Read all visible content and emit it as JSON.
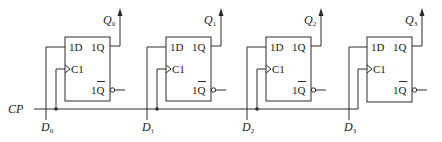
{
  "diagram": {
    "type": "4-bit parallel register (D flip-flops)",
    "clock_label": "CP",
    "flip_flops": [
      {
        "index": 0,
        "d_pin": "1D",
        "clk_pin": "C1",
        "q_pin": "1Q",
        "qbar_pin": "1Q",
        "output_label": "Q",
        "output_sub": "0",
        "input_label": "D",
        "input_sub": "0"
      },
      {
        "index": 1,
        "d_pin": "1D",
        "clk_pin": "C1",
        "q_pin": "1Q",
        "qbar_pin": "1Q",
        "output_label": "Q",
        "output_sub": "1",
        "input_label": "D",
        "input_sub": "1"
      },
      {
        "index": 2,
        "d_pin": "1D",
        "clk_pin": "C1",
        "q_pin": "1Q",
        "qbar_pin": "1Q",
        "output_label": "Q",
        "output_sub": "2",
        "input_label": "D",
        "input_sub": "2"
      },
      {
        "index": 3,
        "d_pin": "1D",
        "clk_pin": "C1",
        "q_pin": "1Q",
        "qbar_pin": "1Q",
        "output_label": "Q",
        "output_sub": "3",
        "input_label": "D",
        "input_sub": "3"
      }
    ],
    "colors": {
      "line": "#2a2a2a",
      "text": "#1a1a1a",
      "background": "#ffffff"
    }
  }
}
